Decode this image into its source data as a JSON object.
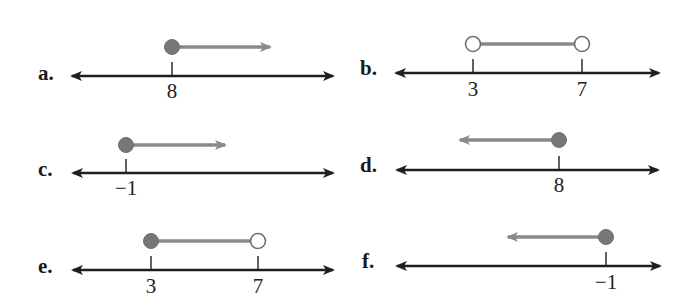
{
  "figure": {
    "width": 692,
    "height": 306,
    "colors": {
      "axis": "#1f1f1f",
      "interval": "#8a8a8a",
      "dot_fill": "#777777",
      "dot_stroke": "#6e6e6e",
      "open_fill": "#ffffff",
      "label": "#1a1a1a"
    }
  },
  "panels": [
    {
      "id": "a",
      "label": "a.",
      "label_pos": [
        38,
        80
      ],
      "axis": {
        "x1": 72,
        "x2": 333,
        "y": 76
      },
      "ticks": [
        {
          "x": 172,
          "label": "8",
          "label_y": 98
        }
      ],
      "graph": {
        "y": 47,
        "points": [
          {
            "x": 172,
            "closed": true
          }
        ],
        "ray": {
          "from": 172,
          "to": 270,
          "direction": "right"
        }
      },
      "inequality": "x ≥ 8"
    },
    {
      "id": "b",
      "label": "b.",
      "label_pos": [
        360,
        75
      ],
      "axis": {
        "x1": 396,
        "x2": 659,
        "y": 73
      },
      "ticks": [
        {
          "x": 473,
          "label": "3",
          "label_y": 96
        },
        {
          "x": 582,
          "label": "7",
          "label_y": 96
        }
      ],
      "graph": {
        "y": 44,
        "points": [
          {
            "x": 473,
            "closed": false
          },
          {
            "x": 582,
            "closed": false
          }
        ],
        "segment": {
          "from": 473,
          "to": 582
        }
      },
      "inequality": "3 < x < 7"
    },
    {
      "id": "c",
      "label": "c.",
      "label_pos": [
        38,
        176
      ],
      "axis": {
        "x1": 73,
        "x2": 333,
        "y": 173
      },
      "ticks": [
        {
          "x": 126,
          "label": "−1",
          "label_y": 195
        }
      ],
      "graph": {
        "y": 145,
        "points": [
          {
            "x": 126,
            "closed": true
          }
        ],
        "ray": {
          "from": 126,
          "to": 225,
          "direction": "right"
        }
      },
      "inequality": "x ≥ −1"
    },
    {
      "id": "d",
      "label": "d.",
      "label_pos": [
        360,
        172
      ],
      "axis": {
        "x1": 397,
        "x2": 658,
        "y": 170
      },
      "ticks": [
        {
          "x": 559,
          "label": "8",
          "label_y": 192
        }
      ],
      "graph": {
        "y": 140,
        "points": [
          {
            "x": 559,
            "closed": true
          }
        ],
        "ray": {
          "from": 559,
          "to": 460,
          "direction": "left"
        }
      },
      "inequality": "x ≤ 8"
    },
    {
      "id": "e",
      "label": "e.",
      "label_pos": [
        38,
        273
      ],
      "axis": {
        "x1": 73,
        "x2": 333,
        "y": 270
      },
      "ticks": [
        {
          "x": 151,
          "label": "3",
          "label_y": 293
        },
        {
          "x": 258,
          "label": "7",
          "label_y": 293
        }
      ],
      "graph": {
        "y": 241,
        "points": [
          {
            "x": 151,
            "closed": true
          },
          {
            "x": 258,
            "closed": false
          }
        ],
        "segment": {
          "from": 151,
          "to": 258
        }
      },
      "inequality": "3 ≤ x < 7"
    },
    {
      "id": "f",
      "label": "f.",
      "label_pos": [
        362,
        268
      ],
      "axis": {
        "x1": 397,
        "x2": 660,
        "y": 266
      },
      "ticks": [
        {
          "x": 606,
          "label": "−1",
          "label_y": 289
        }
      ],
      "graph": {
        "y": 237,
        "points": [
          {
            "x": 606,
            "closed": true
          }
        ],
        "ray": {
          "from": 606,
          "to": 508,
          "direction": "left"
        }
      },
      "inequality": "x ≤ −1"
    }
  ]
}
